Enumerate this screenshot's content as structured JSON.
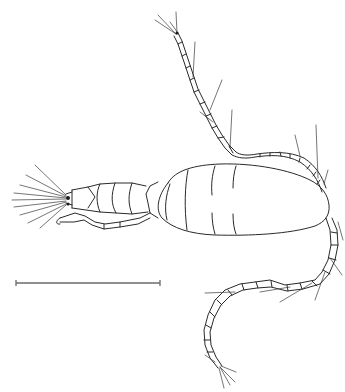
{
  "figure": {
    "style": "line-drawing",
    "ink_color": "#2a2a2a",
    "background": "#ffffff"
  },
  "scale_bar": {
    "x1": 16,
    "x2": 160,
    "y": 283,
    "color": "#6a6a6a"
  }
}
